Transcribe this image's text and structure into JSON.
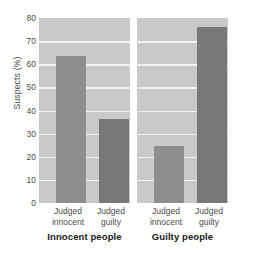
{
  "chart_data": {
    "type": "bar",
    "title": "",
    "subtitle": "",
    "xlabel": "",
    "ylabel": "Suspects (%)",
    "ylim": [
      0,
      80
    ],
    "yticks": [
      0,
      10,
      20,
      30,
      40,
      50,
      60,
      70,
      80
    ],
    "ytick_labels": [
      "0",
      "10",
      "20",
      "30",
      "40",
      "50",
      "60",
      "70",
      "80"
    ],
    "grid": true,
    "grid_axis": "y",
    "legend": false,
    "legend_position": "none",
    "panels": [
      {
        "group_label": "Innocent people",
        "categories": [
          "Judged innocent",
          "Judged guilty"
        ],
        "values": [
          63.5,
          36.5
        ],
        "bar_colors": [
          "#8e8e8e",
          "#787878"
        ]
      },
      {
        "group_label": "Guilty people",
        "categories": [
          "Judged innocent",
          "Judged guilty"
        ],
        "values": [
          24.5,
          76.0
        ],
        "bar_colors": [
          "#8e8e8e",
          "#787878"
        ]
      }
    ],
    "categories": [
      "Judged innocent",
      "Judged guilty",
      "Judged innocent",
      "Judged guilty"
    ],
    "values": [
      63.5,
      36.5,
      24.5,
      76.0
    ],
    "colors": {
      "panel_background": "#c9c9c9",
      "gridline": "#f2f2f2",
      "bar_light": "#8e8e8e",
      "bar_dark": "#787878",
      "figure_background": "#ffffff",
      "tick_text": "#4a4a4a",
      "group_text": "#1a1a1a"
    }
  },
  "axis": {
    "y_title": "Suspects (%)",
    "y_tick_labels": [
      "80",
      "70",
      "60",
      "50",
      "40",
      "30",
      "20",
      "10",
      "0"
    ]
  },
  "categories": {
    "line1": "Judged",
    "innocent_line2": "innocent",
    "guilty_line2": "guilty"
  },
  "groups": {
    "left": "Innocent people",
    "right": "Guilty people"
  }
}
